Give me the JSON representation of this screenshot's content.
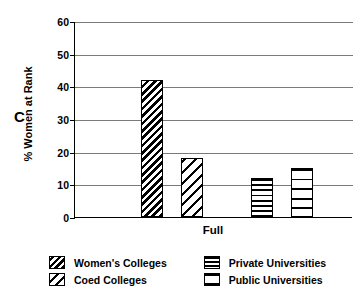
{
  "panel": {
    "label": "C"
  },
  "chart_data": {
    "type": "bar",
    "title": "",
    "subtitle": "",
    "xlabel": "Full",
    "ylabel": "% Women at Rank",
    "categories": [
      "Full"
    ],
    "ylim": [
      0,
      60
    ],
    "yticks": [
      0,
      10,
      20,
      30,
      40,
      50,
      60
    ],
    "ytick_labels": [
      "0",
      "10",
      "20",
      "30",
      "40",
      "50",
      "60"
    ],
    "grid": "horizontal",
    "legend_position": "bottom",
    "series": [
      {
        "name": "Women's Colleges",
        "values": [
          42
        ],
        "pattern": "dense-diagonal"
      },
      {
        "name": "Coed Colleges",
        "values": [
          18
        ],
        "pattern": "sparse-diagonal"
      },
      {
        "name": "Private Universities",
        "values": [
          12
        ],
        "pattern": "dense-horizontal"
      },
      {
        "name": "Public Universities",
        "values": [
          15
        ],
        "pattern": "sparse-horizontal"
      }
    ]
  },
  "legend": {
    "left_column": [
      {
        "label": "Women's Colleges"
      },
      {
        "label": "Coed Colleges"
      }
    ],
    "right_column": [
      {
        "label": "Private Universities"
      },
      {
        "label": "Public Universities"
      }
    ]
  },
  "colors": {
    "ink": "#000000",
    "grid": "#7a7a7a",
    "background": "#ffffff"
  }
}
